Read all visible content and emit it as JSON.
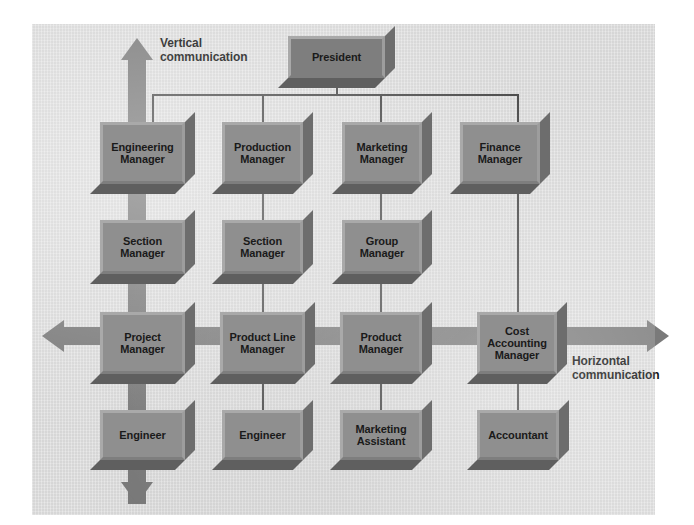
{
  "diagram": {
    "background_color": "#dcdcdc",
    "box_fill_color": "#8f8f8f",
    "connector_color": "#4a4a4a",
    "arrow_color": "#7a7a7a",
    "captions": {
      "vertical": "Vertical\ncommunication",
      "vertical_line1": "Vertical",
      "vertical_line2": "communication",
      "horizontal_line1": "Horizontal",
      "horizontal_line2": "communication"
    },
    "rows": [
      {
        "name": "executive",
        "nodes": [
          {
            "id": "president",
            "label_line1": "President",
            "label_line2": "",
            "label_line3": "",
            "column": 2
          }
        ]
      },
      {
        "name": "functional-managers",
        "nodes": [
          {
            "id": "engineering-manager",
            "label_line1": "Engineering",
            "label_line2": "Manager",
            "label_line3": "",
            "column": 1
          },
          {
            "id": "production-manager",
            "label_line1": "Production",
            "label_line2": "Manager",
            "label_line3": "",
            "column": 2
          },
          {
            "id": "marketing-manager",
            "label_line1": "Marketing",
            "label_line2": "Manager",
            "label_line3": "",
            "column": 3
          },
          {
            "id": "finance-manager",
            "label_line1": "Finance",
            "label_line2": "Manager",
            "label_line3": "",
            "column": 4
          }
        ]
      },
      {
        "name": "section-managers",
        "nodes": [
          {
            "id": "section-manager-engineering",
            "label_line1": "Section",
            "label_line2": "Manager",
            "label_line3": "",
            "column": 1
          },
          {
            "id": "section-manager-production",
            "label_line1": "Section",
            "label_line2": "Manager",
            "label_line3": "",
            "column": 2
          },
          {
            "id": "group-manager-marketing",
            "label_line1": "Group",
            "label_line2": "Manager",
            "label_line3": "",
            "column": 3
          }
        ]
      },
      {
        "name": "project-managers",
        "nodes": [
          {
            "id": "project-manager",
            "label_line1": "Project",
            "label_line2": "Manager",
            "label_line3": "",
            "column": 1
          },
          {
            "id": "product-line-manager",
            "label_line1": "Product Line",
            "label_line2": "Manager",
            "label_line3": "",
            "column": 2
          },
          {
            "id": "product-manager",
            "label_line1": "Product",
            "label_line2": "Manager",
            "label_line3": "",
            "column": 3
          },
          {
            "id": "cost-accounting-manager",
            "label_line1": "Cost",
            "label_line2": "Accounting",
            "label_line3": "Manager",
            "column": 4
          }
        ]
      },
      {
        "name": "staff",
        "nodes": [
          {
            "id": "engineer-1",
            "label_line1": "Engineer",
            "label_line2": "",
            "label_line3": "",
            "column": 1
          },
          {
            "id": "engineer-2",
            "label_line1": "Engineer",
            "label_line2": "",
            "label_line3": "",
            "column": 2
          },
          {
            "id": "marketing-assistant",
            "label_line1": "Marketing",
            "label_line2": "Assistant",
            "label_line3": "",
            "column": 3
          },
          {
            "id": "accountant",
            "label_line1": "Accountant",
            "label_line2": "",
            "label_line3": "",
            "column": 4
          }
        ]
      }
    ]
  }
}
